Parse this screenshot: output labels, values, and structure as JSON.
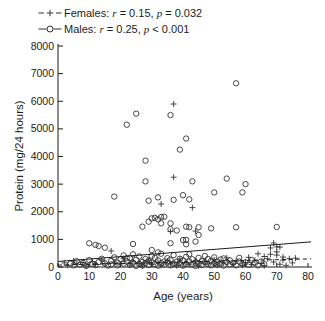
{
  "figure": {
    "background": "#ffffff",
    "ink_color": "#1c1c1c",
    "marker_color": "#333333"
  },
  "chart_data": {
    "type": "scatter",
    "title": "",
    "xlabel": "Age (years)",
    "ylabel": "Protein (mg/24 hours)",
    "xlim": [
      0,
      80
    ],
    "ylim": [
      0,
      8000
    ],
    "xticks": [
      0,
      10,
      20,
      30,
      40,
      50,
      60,
      70,
      80
    ],
    "yticks": [
      0,
      1000,
      2000,
      3000,
      4000,
      5000,
      6000,
      7000,
      8000
    ],
    "grid": false,
    "legend_position": "top-left",
    "series": [
      {
        "name": "Females",
        "marker": "plus",
        "line_style": "dashed",
        "r": 0.15,
        "p": "= 0.032",
        "legend": {
          "prefix": "Females: ",
          "r_sym": "r",
          "r_rest": " = 0.15, ",
          "p_sym": "p",
          "p_rest": " = 0.032"
        },
        "trend": {
          "x": [
            0,
            81
          ],
          "y": [
            70,
            295
          ]
        },
        "points": [
          [
            37,
            5900
          ],
          [
            37,
            3250
          ],
          [
            33,
            2280
          ],
          [
            43,
            2150
          ],
          [
            36,
            1280
          ],
          [
            44,
            1300
          ],
          [
            17,
            580
          ],
          [
            64,
            480
          ],
          [
            66,
            380
          ],
          [
            68,
            690
          ],
          [
            68,
            460
          ],
          [
            69,
            870
          ],
          [
            70,
            730
          ],
          [
            70,
            550
          ],
          [
            70,
            430
          ],
          [
            71,
            720
          ],
          [
            72,
            360
          ],
          [
            74,
            300
          ],
          [
            2,
            150
          ],
          [
            3,
            60
          ],
          [
            5,
            220
          ],
          [
            6,
            100
          ],
          [
            8,
            160
          ],
          [
            9,
            40
          ],
          [
            11,
            200
          ],
          [
            12,
            90
          ],
          [
            14,
            260
          ],
          [
            15,
            130
          ],
          [
            18,
            180
          ],
          [
            20,
            110
          ],
          [
            21,
            300
          ],
          [
            23,
            70
          ],
          [
            24,
            210
          ],
          [
            26,
            140
          ],
          [
            27,
            40
          ],
          [
            29,
            250
          ],
          [
            30,
            100
          ],
          [
            32,
            170
          ],
          [
            33,
            60
          ],
          [
            35,
            230
          ],
          [
            36,
            120
          ],
          [
            38,
            50
          ],
          [
            39,
            290
          ],
          [
            41,
            160
          ],
          [
            42,
            80
          ],
          [
            44,
            220
          ],
          [
            45,
            40
          ],
          [
            47,
            190
          ],
          [
            48,
            110
          ],
          [
            50,
            260
          ],
          [
            51,
            70
          ],
          [
            53,
            150
          ],
          [
            54,
            330
          ],
          [
            56,
            100
          ],
          [
            57,
            210
          ],
          [
            59,
            60
          ],
          [
            60,
            160
          ],
          [
            61,
            350
          ],
          [
            62,
            90
          ],
          [
            63,
            240
          ],
          [
            65,
            130
          ],
          [
            66,
            50
          ],
          [
            67,
            300
          ],
          [
            69,
            180
          ],
          [
            71,
            100
          ],
          [
            72,
            250
          ],
          [
            73,
            60
          ],
          [
            75,
            150
          ],
          [
            76,
            320
          ]
        ]
      },
      {
        "name": "Males",
        "marker": "circle",
        "line_style": "solid",
        "r": 0.25,
        "p": "< 0.001",
        "legend": {
          "prefix": "Males: ",
          "r_sym": "r",
          "r_rest": " = 0.25, ",
          "p_sym": "p",
          "p_rest": " < 0.001"
        },
        "trend": {
          "x": [
            0,
            81
          ],
          "y": [
            200,
            910
          ]
        },
        "points": [
          [
            57,
            6650
          ],
          [
            25,
            5550
          ],
          [
            36,
            5500
          ],
          [
            22,
            5150
          ],
          [
            41,
            4650
          ],
          [
            39,
            4250
          ],
          [
            28,
            3850
          ],
          [
            54,
            3200
          ],
          [
            43,
            3100
          ],
          [
            28,
            3100
          ],
          [
            60,
            3000
          ],
          [
            59,
            2700
          ],
          [
            50,
            2700
          ],
          [
            40,
            2600
          ],
          [
            18,
            2550
          ],
          [
            32,
            2520
          ],
          [
            42,
            2450
          ],
          [
            37,
            2430
          ],
          [
            29,
            2400
          ],
          [
            33,
            1810
          ],
          [
            34,
            1820
          ],
          [
            31,
            1780
          ],
          [
            30,
            1760
          ],
          [
            32,
            1730
          ],
          [
            29,
            1640
          ],
          [
            33,
            1580
          ],
          [
            36,
            1580
          ],
          [
            27,
            1460
          ],
          [
            41,
            1460
          ],
          [
            42,
            1440
          ],
          [
            45,
            1440
          ],
          [
            57,
            1440
          ],
          [
            70,
            1450
          ],
          [
            49,
            1400
          ],
          [
            36,
            1370
          ],
          [
            38,
            1320
          ],
          [
            45,
            1160
          ],
          [
            41,
            980
          ],
          [
            40,
            975
          ],
          [
            44,
            920
          ],
          [
            36,
            860
          ],
          [
            10,
            858
          ],
          [
            24,
            833
          ],
          [
            41,
            822
          ],
          [
            12,
            800
          ],
          [
            13,
            760
          ],
          [
            15,
            700
          ],
          [
            30,
            615
          ],
          [
            32,
            530
          ],
          [
            24,
            460
          ],
          [
            22,
            315
          ],
          [
            4,
            120
          ],
          [
            5,
            60
          ],
          [
            6,
            210
          ],
          [
            7,
            90
          ],
          [
            8,
            150
          ],
          [
            9,
            40
          ],
          [
            10,
            250
          ],
          [
            11,
            110
          ],
          [
            12,
            70
          ],
          [
            13,
            180
          ],
          [
            14,
            300
          ],
          [
            15,
            130
          ],
          [
            16,
            50
          ],
          [
            17,
            220
          ],
          [
            17,
            90
          ],
          [
            18,
            350
          ],
          [
            19,
            160
          ],
          [
            19,
            60
          ],
          [
            20,
            280
          ],
          [
            21,
            120
          ],
          [
            21,
            420
          ],
          [
            22,
            200
          ],
          [
            23,
            80
          ],
          [
            23,
            330
          ],
          [
            24,
            150
          ],
          [
            25,
            40
          ],
          [
            25,
            260
          ],
          [
            26,
            110
          ],
          [
            26,
            380
          ],
          [
            27,
            180
          ],
          [
            27,
            60
          ],
          [
            28,
            290
          ],
          [
            28,
            140
          ],
          [
            29,
            220
          ],
          [
            29,
            70
          ],
          [
            30,
            400
          ],
          [
            30,
            160
          ],
          [
            31,
            100
          ],
          [
            31,
            330
          ],
          [
            32,
            240
          ],
          [
            32,
            50
          ],
          [
            33,
            140
          ],
          [
            33,
            480
          ],
          [
            34,
            200
          ],
          [
            34,
            90
          ],
          [
            35,
            320
          ],
          [
            35,
            160
          ],
          [
            36,
            60
          ],
          [
            36,
            260
          ],
          [
            37,
            120
          ],
          [
            37,
            430
          ],
          [
            38,
            190
          ],
          [
            38,
            80
          ],
          [
            39,
            300
          ],
          [
            39,
            150
          ],
          [
            40,
            240
          ],
          [
            40,
            50
          ],
          [
            41,
            370
          ],
          [
            41,
            110
          ],
          [
            42,
            200
          ],
          [
            42,
            460
          ],
          [
            43,
            90
          ],
          [
            43,
            280
          ],
          [
            44,
            160
          ],
          [
            44,
            40
          ],
          [
            45,
            330
          ],
          [
            45,
            120
          ],
          [
            46,
            220
          ],
          [
            46,
            70
          ],
          [
            47,
            400
          ],
          [
            47,
            170
          ],
          [
            48,
            100
          ],
          [
            48,
            290
          ],
          [
            49,
            60
          ],
          [
            49,
            230
          ],
          [
            50,
            140
          ],
          [
            50,
            350
          ],
          [
            51,
            200
          ],
          [
            51,
            80
          ],
          [
            52,
            270
          ],
          [
            52,
            120
          ],
          [
            53,
            50
          ],
          [
            53,
            310
          ],
          [
            54,
            180
          ],
          [
            55,
            90
          ],
          [
            55,
            240
          ],
          [
            56,
            150
          ],
          [
            57,
            60
          ],
          [
            58,
            200
          ],
          [
            58,
            330
          ],
          [
            59,
            110
          ],
          [
            60,
            170
          ],
          [
            61,
            80
          ],
          [
            62,
            250
          ],
          [
            63,
            140
          ],
          [
            64,
            60
          ],
          [
            65,
            200
          ],
          [
            66,
            100
          ]
        ]
      }
    ]
  }
}
